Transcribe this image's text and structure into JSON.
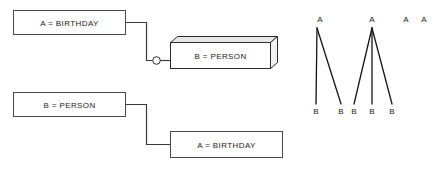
{
  "diagram": {
    "background_color": "#ffffff",
    "line_color": "#3a3a3a",
    "text_color": "#1a1a1a",
    "boxes": [
      {
        "id": "box-a-birthday-top",
        "label": "A = BIRTHDAY",
        "style": "flat",
        "x": 13,
        "y": 10,
        "w": 112,
        "h": 24
      },
      {
        "id": "box-b-person-3d",
        "label": "B = PERSON",
        "style": "three-d",
        "x": 170,
        "y": 42,
        "w": 112,
        "h": 26
      },
      {
        "id": "box-b-person-bottom",
        "label": "B = PERSON",
        "style": "flat",
        "x": 13,
        "y": 92,
        "w": 112,
        "h": 24
      },
      {
        "id": "box-a-birthday-bottom",
        "label": "A = BIRTHDAY",
        "style": "flat",
        "x": 170,
        "y": 131,
        "w": 112,
        "h": 26
      }
    ],
    "connectors": [
      {
        "id": "connector-top",
        "from": "box-a-birthday-top",
        "to": "box-b-person-3d",
        "has_circle": true,
        "circle_label": "optionality-circle"
      },
      {
        "id": "connector-bottom",
        "from": "box-b-person-bottom",
        "to": "box-a-birthday-bottom",
        "has_circle": false
      }
    ],
    "trees": [
      {
        "id": "tree-one-to-two",
        "root_label": "A",
        "leaf_labels": [
          "B",
          "B"
        ],
        "root_x": 320,
        "root_y": 19,
        "leaves_x": [
          316,
          340
        ],
        "leaf_y": 112
      },
      {
        "id": "tree-one-to-three",
        "root_label": "A",
        "leaf_labels": [
          "B",
          "B",
          "B"
        ],
        "root_x": 372,
        "root_y": 19,
        "leaves_x": [
          354,
          372,
          392
        ],
        "leaf_y": 112
      }
    ],
    "orphan_nodes": [
      {
        "id": "orphan-a-1",
        "label": "A",
        "x": 406,
        "y": 19
      },
      {
        "id": "orphan-a-2",
        "label": "A",
        "x": 424,
        "y": 19
      }
    ]
  }
}
